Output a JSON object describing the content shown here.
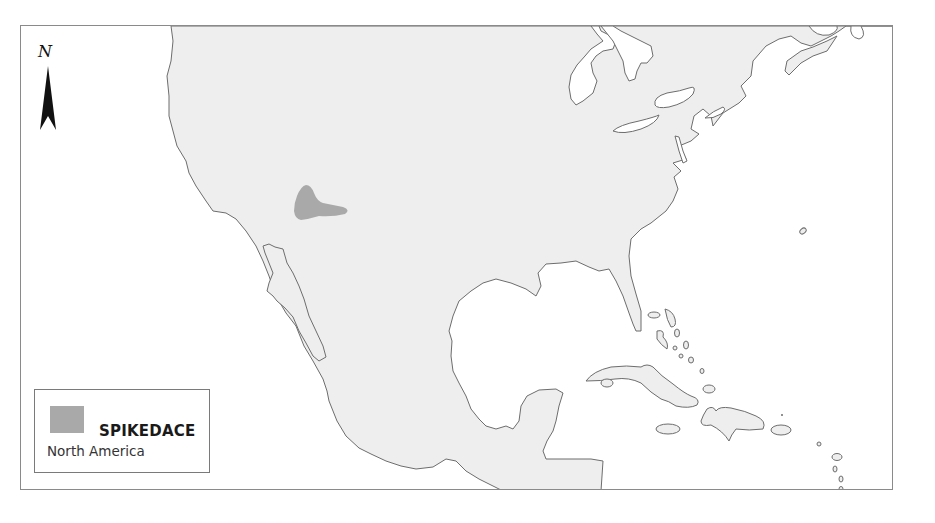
{
  "map": {
    "region": "North America",
    "compass": {
      "label": "N",
      "icon": "north-arrow-icon"
    },
    "legend": {
      "species": "SPIKEDACE",
      "region": "North America",
      "swatch_color": "#a9a9a9"
    },
    "colors": {
      "land": "#eeeeee",
      "water": "#ffffff",
      "coastline": "#6d6d6d",
      "range": "#a9a9a9",
      "frame": "#8a8a8a"
    }
  }
}
